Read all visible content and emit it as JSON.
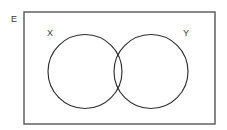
{
  "diagram": {
    "type": "venn",
    "canvas": {
      "width": 227,
      "height": 130,
      "background": "#ffffff"
    },
    "universe": {
      "label": "E",
      "label_name": "universal-set-label",
      "label_position": {
        "x": 14,
        "y": 20
      },
      "rect": {
        "x": 24,
        "y": 12,
        "width": 191,
        "height": 112
      },
      "stroke_color": "#555555",
      "fill_color": "#ffffff",
      "stroke_width": 1.4
    },
    "sets": [
      {
        "label": "X",
        "name": "set-x",
        "cx": 85,
        "cy": 71.5,
        "r": 37,
        "label_position": {
          "x": 50,
          "y": 34
        },
        "label_anchor": "middle",
        "stroke_color": "#2e2e2e",
        "fill": "none"
      },
      {
        "label": "Y",
        "name": "set-y",
        "cx": 151,
        "cy": 71.5,
        "r": 37,
        "label_position": {
          "x": 186,
          "y": 34
        },
        "label_anchor": "middle",
        "stroke_color": "#2e2e2e",
        "fill": "none"
      }
    ],
    "intersection": {
      "present": true,
      "label": "",
      "shaded": false
    }
  }
}
